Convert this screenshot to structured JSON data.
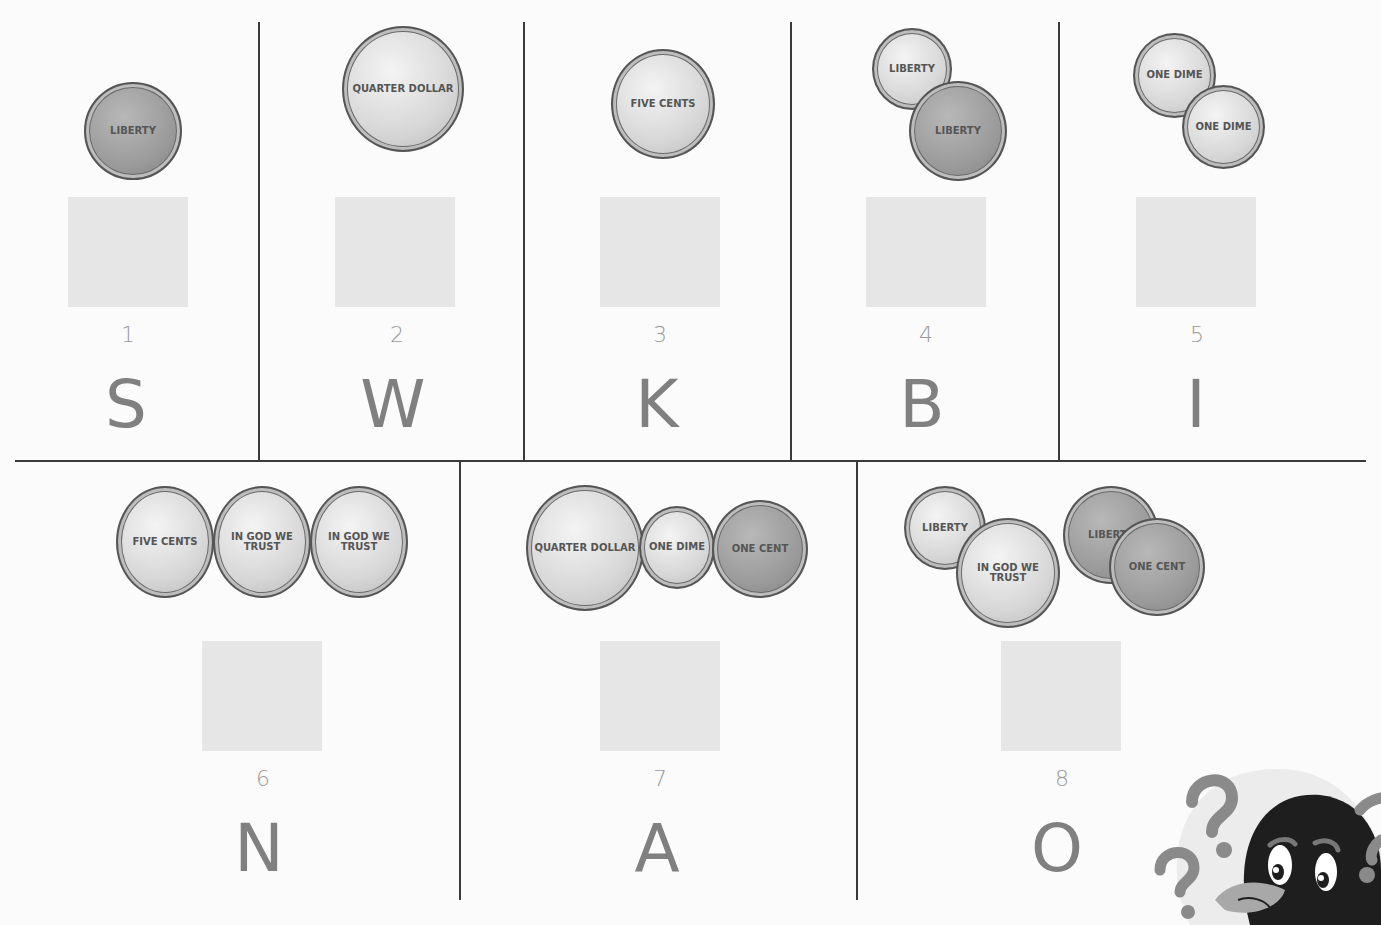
{
  "worksheet": {
    "cells": [
      {
        "number": "1",
        "letter": "S",
        "coins": [
          "penny"
        ],
        "coin_labels": [
          "LIBERTY"
        ]
      },
      {
        "number": "2",
        "letter": "W",
        "coins": [
          "quarter"
        ],
        "coin_labels": [
          "QUARTER DOLLAR"
        ]
      },
      {
        "number": "3",
        "letter": "K",
        "coins": [
          "nickel"
        ],
        "coin_labels": [
          "FIVE CENTS"
        ]
      },
      {
        "number": "4",
        "letter": "B",
        "coins": [
          "dime",
          "penny"
        ],
        "coin_labels": [
          "LIBERTY",
          "LIBERTY"
        ]
      },
      {
        "number": "5",
        "letter": "I",
        "coins": [
          "dime",
          "dime"
        ],
        "coin_labels": [
          "ONE DIME",
          "ONE DIME"
        ]
      },
      {
        "number": "6",
        "letter": "N",
        "coins": [
          "nickel",
          "nickel",
          "nickel"
        ],
        "coin_labels": [
          "FIVE CENTS",
          "IN GOD WE TRUST",
          "IN GOD WE TRUST"
        ]
      },
      {
        "number": "7",
        "letter": "A",
        "coins": [
          "quarter",
          "dime",
          "penny"
        ],
        "coin_labels": [
          "QUARTER DOLLAR",
          "ONE DIME",
          "ONE CENT"
        ]
      },
      {
        "number": "8",
        "letter": "O",
        "coins": [
          "dime",
          "nickel",
          "penny",
          "penny"
        ],
        "coin_labels": [
          "LIBERTY",
          "IN GOD WE TRUST",
          "LIBERTY",
          "ONE CENT"
        ]
      }
    ]
  },
  "colors": {
    "line": "#3a3a3a",
    "answer_box": "#e6e6e6",
    "number_text": "#9a9a9a",
    "letter_text": "#808080"
  },
  "decoration": {
    "mascot": "penguin-with-question-marks"
  }
}
